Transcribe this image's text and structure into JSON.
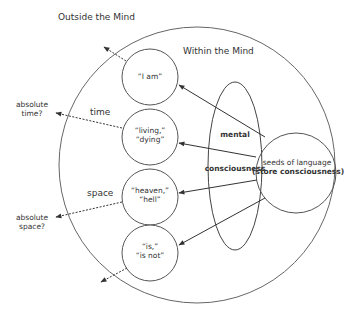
{
  "diagram": {
    "outside_label": "Outside the Mind",
    "within_label": "Within the Mind",
    "concepts": [
      {
        "id": "i-am",
        "line1": "“I am”",
        "line2": ""
      },
      {
        "id": "living-dying",
        "line1": "“living,”",
        "line2": "“dying”"
      },
      {
        "id": "heaven-hell",
        "line1": "“heaven,”",
        "line2": "“hell”"
      },
      {
        "id": "is-is-not",
        "line1": "“is,”",
        "line2": "“is not”"
      }
    ],
    "mental_consciousness": {
      "line1": "mental",
      "line2": "consciousness"
    },
    "seeds": {
      "line1": "seeds of language",
      "line2": "(store consciousness)"
    },
    "dimension_labels": {
      "time": "time",
      "space": "space"
    },
    "outside_labels": {
      "absolute_time": {
        "line1": "absolute",
        "line2": "time?"
      },
      "absolute_space": {
        "line1": "absolute",
        "line2": "space?"
      }
    },
    "colors": {
      "stroke": "#555555",
      "text": "#333333",
      "background": "#ffffff"
    }
  }
}
